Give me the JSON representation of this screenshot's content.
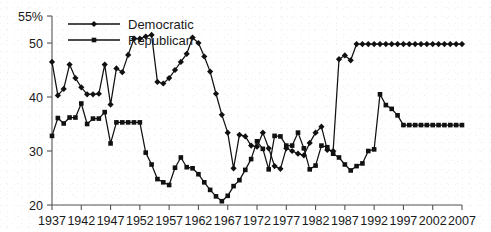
{
  "chart_data": {
    "type": "line",
    "title": "",
    "subtitle": "",
    "xlabel": "",
    "ylabel": "",
    "xlim": [
      1937,
      2007
    ],
    "ylim": [
      20,
      55
    ],
    "grid": false,
    "legend_position": "top-left",
    "y_ticks": [
      "20",
      "30",
      "40",
      "50",
      "55%"
    ],
    "y_tick_values": [
      20,
      30,
      40,
      50,
      55
    ],
    "x_ticks": [
      "1937",
      "1942",
      "1947",
      "1952",
      "1957",
      "1962",
      "1967",
      "1972",
      "1977",
      "1982",
      "1987",
      "1992",
      "1997",
      "2002",
      "2007"
    ],
    "x_tick_values": [
      1937,
      1942,
      1947,
      1952,
      1957,
      1962,
      1967,
      1972,
      1977,
      1982,
      1987,
      1992,
      1997,
      2002,
      2007
    ],
    "x": [
      1937,
      1938,
      1939,
      1940,
      1941,
      1942,
      1943,
      1944,
      1945,
      1946,
      1947,
      1948,
      1949,
      1950,
      1951,
      1952,
      1953,
      1954,
      1955,
      1956,
      1957,
      1958,
      1959,
      1960,
      1961,
      1962,
      1963,
      1964,
      1965,
      1966,
      1967,
      1968,
      1969,
      1970,
      1971,
      1972,
      1973,
      1974,
      1975,
      1976,
      1977,
      1978,
      1979,
      1980,
      1981,
      1982,
      1983,
      1984,
      1985,
      1986,
      1987,
      1988,
      1989,
      1990,
      1991,
      1992,
      1993,
      1994,
      1995,
      1996,
      1997,
      1998,
      1999,
      2000,
      2001,
      2002,
      2003,
      2004,
      2005,
      2006,
      2007
    ],
    "series": [
      {
        "name": "Democratic",
        "marker": "diamond",
        "color": "#111111",
        "values": [
          46.5,
          40.3,
          41.5,
          46.0,
          43.5,
          41.8,
          40.5,
          40.5,
          40.6,
          46.0,
          38.6,
          45.3,
          44.6,
          47.8,
          50.8,
          50.8,
          51.2,
          51.5,
          42.8,
          42.5,
          43.5,
          45.0,
          46.5,
          48.0,
          51.0,
          50.0,
          47.5,
          44.7,
          40.6,
          36.7,
          33.4,
          26.8,
          33.0,
          32.7,
          31.0,
          30.8,
          33.4,
          30.5,
          27.2,
          26.7,
          30.5,
          30.0,
          29.5,
          29.2,
          31.5,
          33.4,
          34.5,
          30.2,
          30.0,
          47.0,
          47.7,
          46.8,
          49.8,
          49.8,
          49.8,
          49.8,
          49.8,
          49.8,
          49.8,
          49.8,
          49.8,
          49.8,
          49.8,
          49.8,
          49.8,
          49.8,
          49.8,
          49.8,
          49.8,
          49.8,
          49.8
        ]
      },
      {
        "name": "Republican",
        "marker": "square",
        "color": "#111111",
        "values": [
          32.8,
          36.1,
          35.1,
          36.2,
          36.2,
          38.8,
          35.0,
          36.0,
          36.0,
          37.2,
          31.4,
          35.3,
          35.3,
          35.3,
          35.3,
          35.3,
          29.7,
          27.5,
          24.8,
          24.2,
          23.7,
          26.9,
          28.8,
          27.0,
          26.8,
          25.7,
          24.2,
          22.8,
          21.6,
          20.7,
          21.7,
          23.5,
          24.6,
          26.5,
          28.5,
          31.8,
          30.4,
          26.6,
          32.8,
          32.7,
          31.0,
          31.0,
          33.4,
          30.5,
          26.6,
          27.3,
          31.0,
          30.7,
          29.5,
          28.8,
          27.5,
          26.4,
          27.2,
          27.7,
          30.0,
          30.3,
          40.5,
          38.5,
          37.8,
          36.6,
          34.8,
          34.8,
          34.8,
          34.8,
          34.8,
          34.8,
          34.8,
          34.8,
          34.8,
          34.8,
          34.8
        ]
      }
    ]
  },
  "legend": {
    "items": [
      {
        "label": "Democratic"
      },
      {
        "label": "Republican"
      }
    ]
  }
}
